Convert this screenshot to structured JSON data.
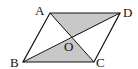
{
  "figure": {
    "type": "parallelogram-with-diagonals",
    "vertices": {
      "A": {
        "x": 50,
        "y": 13
      },
      "B": {
        "x": 23,
        "y": 62
      },
      "C": {
        "x": 94,
        "y": 62
      },
      "D": {
        "x": 120,
        "y": 13
      },
      "O": {
        "x": 72,
        "y": 38
      }
    },
    "labels": {
      "A": "A",
      "B": "B",
      "C": "C",
      "D": "D",
      "O": "O"
    },
    "shaded_regions": [
      "triangle AOD",
      "triangle BOC"
    ],
    "colors": {
      "stroke": "#111111",
      "fill": "#c8c8c8"
    }
  }
}
